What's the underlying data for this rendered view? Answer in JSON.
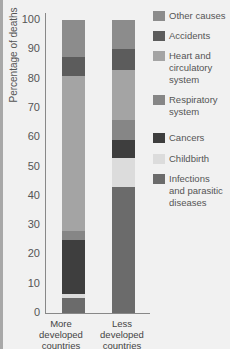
{
  "chart_data": {
    "type": "bar",
    "stacked": true,
    "title": "",
    "xlabel": "",
    "ylabel": "Percentage of deaths",
    "ylim": [
      0,
      100
    ],
    "yticks": [
      0,
      10,
      20,
      30,
      40,
      50,
      60,
      70,
      80,
      90,
      100
    ],
    "categories": [
      "More developed countries",
      "Less developed countries"
    ],
    "series": [
      {
        "name": "Infections and parasitic diseases",
        "color": "#6b6b6b",
        "values": [
          5,
          43
        ]
      },
      {
        "name": "Childbirth",
        "color": "#dcdcdc",
        "values": [
          1.5,
          10
        ]
      },
      {
        "name": "Cancers",
        "color": "#3e3e3e",
        "values": [
          18.5,
          6
        ]
      },
      {
        "name": "Respiratory system",
        "color": "#868686",
        "values": [
          3,
          7
        ]
      },
      {
        "name": "Heart and circulatory system",
        "color": "#a4a4a4",
        "values": [
          53,
          17
        ]
      },
      {
        "name": "Accidents",
        "color": "#5c5c5c",
        "values": [
          6.5,
          7
        ]
      },
      {
        "name": "Other causes",
        "color": "#8c8c8c",
        "values": [
          12.5,
          10
        ]
      }
    ],
    "legend_position": "right",
    "grid": false
  },
  "axis": {
    "ylabel": "Percentage of deaths",
    "ticks": [
      "0",
      "10",
      "20",
      "30",
      "40",
      "50",
      "60",
      "70",
      "80",
      "90",
      "100"
    ]
  },
  "xlabels": [
    "More\ndeveloped\ncountries",
    "Less\ndeveloped\ncountries"
  ],
  "legend": [
    {
      "label": "Other causes",
      "color": "#8c8c8c"
    },
    {
      "label": "Accidents",
      "color": "#5c5c5c"
    },
    {
      "label": "Heart and\ncirculatory\nsystem",
      "color": "#a4a4a4"
    },
    {
      "label": "Respiratory\nsystem",
      "color": "#868686"
    },
    {
      "label": "Cancers",
      "color": "#3e3e3e"
    },
    {
      "label": "Childbirth",
      "color": "#dcdcdc"
    },
    {
      "label": "Infections\nand parasitic\ndiseases",
      "color": "#6b6b6b"
    }
  ]
}
